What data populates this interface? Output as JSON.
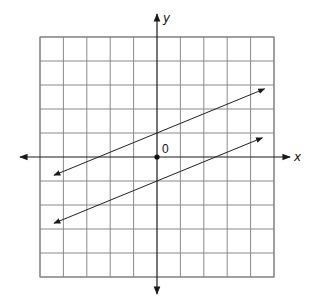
{
  "chart_data": {
    "type": "line",
    "title": "",
    "xlabel": "x",
    "ylabel": "y",
    "origin_label": "0",
    "xlim": [
      -5,
      5
    ],
    "ylim": [
      -5,
      5
    ],
    "grid": true,
    "grid_step": 1,
    "axis_arrows": true,
    "legend": "none",
    "series": [
      {
        "name": "upper line",
        "equation": "y = 0.4x + 1",
        "slope": 0.4,
        "intercept": 1,
        "x_range": [
          -4.4,
          4.6
        ],
        "arrows": "both"
      },
      {
        "name": "lower line",
        "equation": "y = 0.4x - 1",
        "slope": 0.4,
        "intercept": -1,
        "x_range": [
          -4.4,
          4.5
        ],
        "arrows": "both"
      }
    ],
    "points": [
      {
        "name": "origin",
        "x": 0,
        "y": 0
      }
    ],
    "colors": {
      "grid": "#8a8a8a",
      "axis": "#1a1a1a",
      "line": "#222222"
    }
  }
}
